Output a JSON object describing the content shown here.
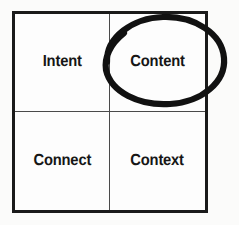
{
  "diagram": {
    "type": "2x2-matrix",
    "title": "",
    "background_color": "#fbfbfa",
    "frame_color": "#1a1a1a",
    "divider_color": "#4a4a4a",
    "label_color": "#161616",
    "annotation_color": "#111111",
    "cells": [
      {
        "id": "intent",
        "label": "Intent",
        "row": 1,
        "col": 1,
        "highlighted": false
      },
      {
        "id": "content",
        "label": "Content",
        "row": 1,
        "col": 2,
        "highlighted": true
      },
      {
        "id": "connect",
        "label": "Connect",
        "row": 2,
        "col": 1,
        "highlighted": false
      },
      {
        "id": "context",
        "label": "Context",
        "row": 2,
        "col": 2,
        "highlighted": false
      }
    ],
    "annotation": {
      "shape": "ellipse",
      "style": "hand-drawn-marker",
      "encircles": "Content",
      "stroke_width": 6
    }
  }
}
